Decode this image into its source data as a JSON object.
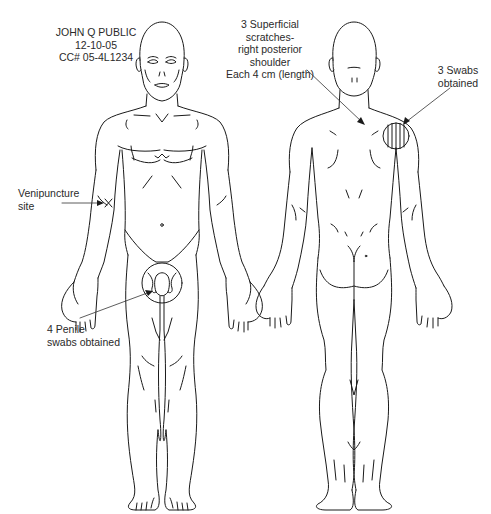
{
  "diagram": {
    "type": "forensic-body-diagram",
    "views": [
      "anterior",
      "posterior"
    ],
    "patient": {
      "name": "JOHN Q PUBLIC",
      "date": "12-10-05",
      "case_number": "CC# 05-4L1234"
    },
    "annotations": {
      "venipuncture": {
        "line1": "Venipuncture",
        "line2": "site",
        "marker": "x-mark"
      },
      "penile": {
        "line1": "4 Penile",
        "line2": "swabs obtained",
        "marker": "circle"
      },
      "scratches": {
        "line1": "3 Superficial",
        "line2": "scratches-",
        "line3": "right posterior",
        "line4": "shoulder",
        "line5": "Each 4 cm (length)"
      },
      "shoulder_swabs": {
        "line1": "3 Swabs",
        "line2": "obtained",
        "marker": "hatched-circle"
      }
    },
    "colors": {
      "line": "#1a1a1a",
      "text": "#2a2a2a",
      "background": "#ffffff"
    }
  }
}
